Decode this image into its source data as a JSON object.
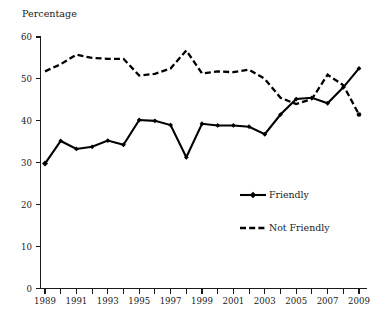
{
  "chart_data": {
    "type": "line",
    "title": "",
    "ylabel": "Percentage",
    "xlabel": "",
    "ylim": [
      0,
      60
    ],
    "ytick_values": [
      0,
      10,
      20,
      30,
      40,
      50,
      60
    ],
    "ytick_labels": [
      "0",
      "10",
      "20",
      "30",
      "40",
      "50",
      "60"
    ],
    "xlim": [
      1989,
      2009
    ],
    "x": [
      1989,
      1990,
      1991,
      1992,
      1993,
      1994,
      1995,
      1996,
      1997,
      1998,
      1999,
      2000,
      2001,
      2002,
      2003,
      2004,
      2005,
      2006,
      2007,
      2008,
      2009
    ],
    "xtick_values": [
      1989,
      1990,
      1991,
      1992,
      1993,
      1994,
      1995,
      1996,
      1997,
      1998,
      1999,
      2000,
      2001,
      2002,
      2003,
      2004,
      2005,
      2006,
      2007,
      2008,
      2009
    ],
    "xtick_labels": [
      "1989",
      "",
      "1991",
      "",
      "1993",
      "",
      "1995",
      "",
      "1997",
      "",
      "1999",
      "",
      "2001",
      "",
      "2003",
      "",
      "2005",
      "",
      "2007",
      "",
      "2009"
    ],
    "grid": false,
    "legend_position": "center-right-inside",
    "series": [
      {
        "name": "Friendly",
        "style": "solid",
        "marker": "diamond",
        "color": "#000000",
        "values": [
          29.8,
          35.2,
          33.3,
          33.8,
          35.3,
          34.3,
          40.2,
          40.0,
          39.0,
          31.3,
          39.3,
          38.9,
          38.9,
          38.6,
          36.8,
          41.5,
          45.2,
          45.5,
          44.2,
          48.0,
          52.5
        ]
      },
      {
        "name": "Not Friendly",
        "style": "dashed",
        "marker": "none",
        "color": "#000000",
        "values": [
          51.8,
          53.5,
          55.8,
          55.0,
          54.8,
          54.8,
          50.8,
          51.2,
          52.5,
          56.8,
          51.3,
          51.8,
          51.6,
          52.2,
          50.0,
          45.5,
          44.0,
          45.2,
          51.0,
          48.5,
          41.5
        ]
      }
    ],
    "legend": [
      {
        "label": "Friendly",
        "style": "solid",
        "marker": "diamond"
      },
      {
        "label": "Not Friendly",
        "style": "dashed",
        "marker": "none"
      }
    ]
  }
}
